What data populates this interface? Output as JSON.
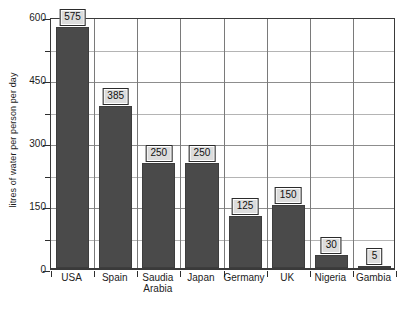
{
  "chart_data": {
    "type": "bar",
    "title": "",
    "xlabel": "",
    "ylabel": "litres of water per person per day",
    "ylim": [
      0,
      600
    ],
    "grid": true,
    "legend": "none",
    "y_major_ticks": [
      0,
      150,
      300,
      450,
      600
    ],
    "y_minor_ticks": [
      75,
      225,
      375,
      525
    ],
    "y_tick_labels": [
      "0",
      "150",
      "300",
      "450",
      "600"
    ],
    "categories": [
      "USA",
      "Spain",
      "Saudia Arabia",
      "Japan",
      "Germany",
      "UK",
      "Nigeria",
      "Gambia"
    ],
    "category_lines": [
      [
        "USA"
      ],
      [
        "Spain"
      ],
      [
        "Saudia",
        "Arabia"
      ],
      [
        "Japan"
      ],
      [
        "Germany"
      ],
      [
        "UK"
      ],
      [
        "Nigeria"
      ],
      [
        "Gambia"
      ]
    ],
    "values": [
      575,
      385,
      250,
      250,
      125,
      150,
      30,
      5
    ],
    "value_labels": [
      "575",
      "385",
      "250",
      "250",
      "125",
      "150",
      "30",
      "5"
    ],
    "colors": {
      "bar_fill": "#4a4a4a",
      "bar_border": "#3d3d3d",
      "plot_border": "#3a3a3a",
      "gridline_major": "#8d8d8d",
      "gridline_minor": "#b4b4b4",
      "label_box_fill": "#dcdcdc",
      "label_box_border": "#2b2b2b",
      "text": "#1c1c1c",
      "background": "#ffffff"
    }
  }
}
